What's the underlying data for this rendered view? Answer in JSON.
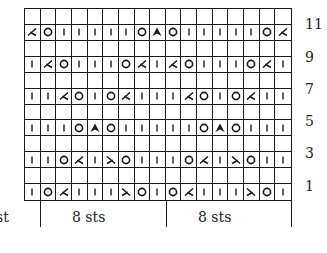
{
  "chart_title": "",
  "grid": {
    "columns": 17,
    "rows": 12,
    "legend_symbols": {
      "|": "knit",
      "O": "yarn-over",
      "L": "k2tog (right-leaning decrease)",
      "R": "ssk (left-leaning decrease)",
      "A": "central double decrease",
      "": "blank (even row)"
    },
    "rows_top_to_bottom": [
      {
        "row": 12,
        "label": "",
        "cells": [
          "",
          "",
          "",
          "",
          "",
          "",
          "",
          "",
          "",
          "",
          "",
          "",
          "",
          "",
          "",
          "",
          ""
        ]
      },
      {
        "row": 11,
        "label": "11",
        "cells": [
          "L",
          "O",
          "|",
          "|",
          "|",
          "|",
          "|",
          "O",
          "A",
          "O",
          "|",
          "|",
          "|",
          "|",
          "|",
          "O",
          "L"
        ]
      },
      {
        "row": 10,
        "label": "",
        "cells": [
          "",
          "",
          "",
          "",
          "",
          "",
          "",
          "",
          "",
          "",
          "",
          "",
          "",
          "",
          "",
          "",
          ""
        ]
      },
      {
        "row": 9,
        "label": "9",
        "cells": [
          "|",
          "L",
          "O",
          "|",
          "|",
          "|",
          "O",
          "L",
          "|",
          "L",
          "O",
          "|",
          "|",
          "|",
          "O",
          "L",
          "|"
        ]
      },
      {
        "row": 8,
        "label": "",
        "cells": [
          "",
          "",
          "",
          "",
          "",
          "",
          "",
          "",
          "",
          "",
          "",
          "",
          "",
          "",
          "",
          "",
          ""
        ]
      },
      {
        "row": 7,
        "label": "7",
        "cells": [
          "|",
          "|",
          "L",
          "O",
          "|",
          "O",
          "L",
          "|",
          "|",
          "|",
          "L",
          "O",
          "|",
          "O",
          "L",
          "|",
          "|"
        ]
      },
      {
        "row": 6,
        "label": "",
        "cells": [
          "",
          "",
          "",
          "",
          "",
          "",
          "",
          "",
          "",
          "",
          "",
          "",
          "",
          "",
          "",
          "",
          ""
        ]
      },
      {
        "row": 5,
        "label": "5",
        "cells": [
          "|",
          "|",
          "|",
          "O",
          "A",
          "O",
          "|",
          "|",
          "|",
          "|",
          "|",
          "O",
          "A",
          "O",
          "|",
          "|",
          "|"
        ]
      },
      {
        "row": 4,
        "label": "",
        "cells": [
          "",
          "",
          "",
          "",
          "",
          "",
          "",
          "",
          "",
          "",
          "",
          "",
          "",
          "",
          "",
          "",
          ""
        ]
      },
      {
        "row": 3,
        "label": "3",
        "cells": [
          "|",
          "|",
          "O",
          "L",
          "|",
          "R",
          "O",
          "|",
          "|",
          "|",
          "O",
          "L",
          "|",
          "R",
          "O",
          "|",
          "|"
        ]
      },
      {
        "row": 2,
        "label": "",
        "cells": [
          "",
          "",
          "",
          "",
          "",
          "",
          "",
          "",
          "",
          "",
          "",
          "",
          "",
          "",
          "",
          "",
          ""
        ]
      },
      {
        "row": 1,
        "label": "1",
        "cells": [
          "|",
          "O",
          "L",
          "|",
          "|",
          "|",
          "R",
          "O",
          "|",
          "O",
          "L",
          "|",
          "|",
          "|",
          "R",
          "O",
          "|"
        ]
      }
    ]
  },
  "row_numbers": [
    {
      "text": "11",
      "top": 17
    },
    {
      "text": "9",
      "top": 50
    },
    {
      "text": "7",
      "top": 82
    },
    {
      "text": "5",
      "top": 114
    },
    {
      "text": "3",
      "top": 146
    },
    {
      "text": "1",
      "top": 179
    }
  ],
  "bottom_labels": {
    "edge": "st",
    "repeat_1": "8 sts",
    "repeat_2": "8 sts"
  },
  "colors": {
    "ink": "#1a1a1a",
    "background": "#ffffff"
  }
}
